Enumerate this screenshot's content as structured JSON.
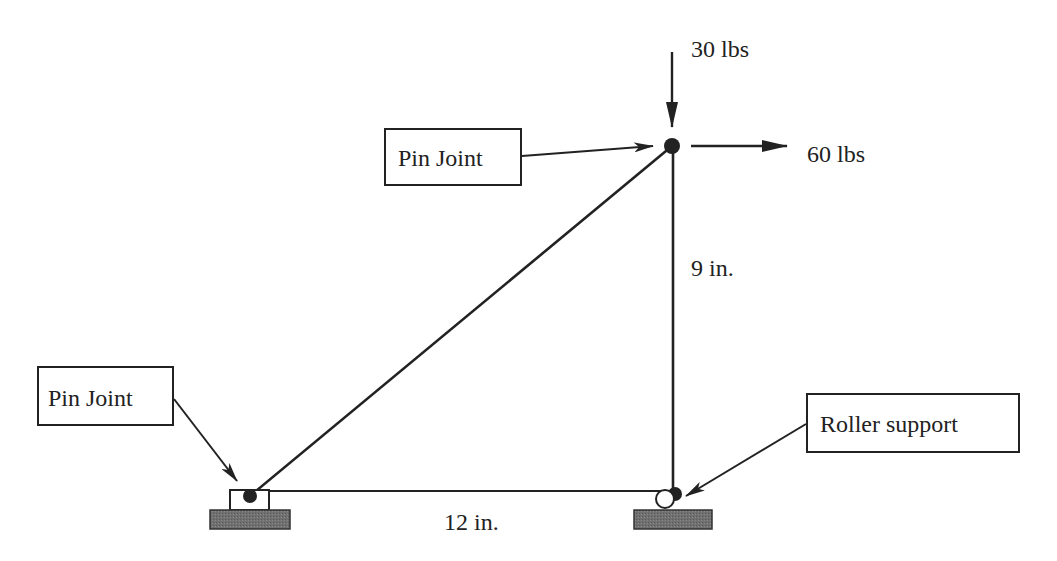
{
  "diagram": {
    "type": "truss",
    "colors": {
      "stroke": "#222222",
      "ground_fill": "#6a6a6a",
      "background": "#ffffff"
    },
    "members": [
      {
        "id": "diagonal",
        "from": "A",
        "to": "B"
      },
      {
        "id": "vertical",
        "from": "B",
        "to": "C"
      },
      {
        "id": "horizontal",
        "from": "A",
        "to": "C"
      }
    ],
    "joints": {
      "A": {
        "type": "pin",
        "x": 250,
        "y": 496
      },
      "B": {
        "type": "pin",
        "x": 672,
        "y": 146
      },
      "C": {
        "type": "roller",
        "x": 674,
        "y": 493
      }
    },
    "loads": {
      "vertical": {
        "label": "30 lbs",
        "direction": "down"
      },
      "horizontal": {
        "label": "60 lbs",
        "direction": "right"
      }
    },
    "dimensions": {
      "height": "9 in.",
      "width": "12 in."
    },
    "callouts": {
      "top_pin": "Pin Joint",
      "bottom_pin": "Pin Joint",
      "roller": "Roller support"
    }
  }
}
